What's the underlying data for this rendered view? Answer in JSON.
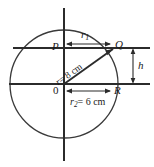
{
  "figure": {
    "type": "geometry-diagram",
    "background_color": "#ffffff",
    "line_color": "#2b2b2b",
    "circle_color": "#3a3a3a",
    "points": {
      "p": "P",
      "q": "Q",
      "o": "0",
      "r": "R"
    },
    "labels": {
      "r1": "r",
      "r1_sub": "1",
      "r2_name": "r",
      "r2_sub": "2",
      "r2_eq": "= 6 cm",
      "r2_full": "r2 = 6 cm",
      "radius_name": "r",
      "radius_eq": "= 8 cm",
      "radius_full": "r = 8 cm",
      "height": "h"
    },
    "geometry": {
      "circle_center_x": 64,
      "circle_center_y": 84,
      "circle_radius": 54,
      "chord_y": 48,
      "diameter_y": 84,
      "q_x": 113,
      "q_y": 48,
      "r_x": 112,
      "r_y": 84,
      "p_x": 64,
      "p_y": 48,
      "right_extent": 150,
      "axis_top": 8,
      "axis_bottom": 160,
      "h_bracket_x": 133
    }
  }
}
